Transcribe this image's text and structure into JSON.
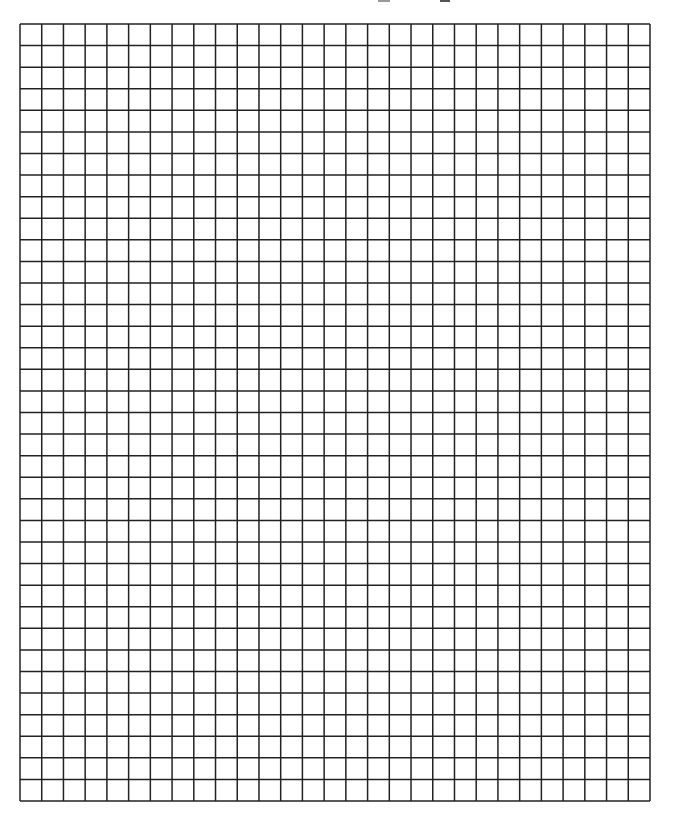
{
  "page": {
    "type": "graph-paper-worksheet",
    "background": "#ffffff"
  },
  "header": {
    "visible_text": "",
    "note": "top edge shows only cut-off illegible fragments"
  },
  "grid": {
    "columns": 29,
    "rows": 36,
    "cell_size_px": 21.7,
    "origin_x": 20,
    "origin_y": 24,
    "width_px": 630,
    "height_px": 777,
    "line_color": "#222222",
    "line_width_px": 1.5
  }
}
